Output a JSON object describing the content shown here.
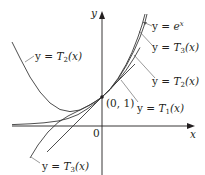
{
  "figure": {
    "axes": {
      "x_label": "x",
      "y_label": "y",
      "origin_label": "0"
    },
    "point": {
      "label": "(0, 1)"
    },
    "curves": [
      {
        "id": "exp",
        "label_prefix": "y = ",
        "label_main": "e",
        "label_sup": "x",
        "label_sub": "",
        "label_suffix": ""
      },
      {
        "id": "t3_upper",
        "label_prefix": "y = ",
        "label_main": "T",
        "label_sup": "",
        "label_sub": "3",
        "label_suffix": "(x)"
      },
      {
        "id": "t2_right",
        "label_prefix": "y = ",
        "label_main": "T",
        "label_sup": "",
        "label_sub": "2",
        "label_suffix": "(x)"
      },
      {
        "id": "t1",
        "label_prefix": "y = ",
        "label_main": "T",
        "label_sup": "",
        "label_sub": "1",
        "label_suffix": "(x)"
      },
      {
        "id": "t2_left",
        "label_prefix": "y = ",
        "label_main": "T",
        "label_sup": "",
        "label_sub": "2",
        "label_suffix": "(x)"
      },
      {
        "id": "t3_lower",
        "label_prefix": "y = ",
        "label_main": "T",
        "label_sup": "",
        "label_sub": "3",
        "label_suffix": "(x)"
      }
    ],
    "colors": {
      "curve": "#3a3a3a",
      "axis": "#231f20",
      "leader": "#555555"
    }
  }
}
